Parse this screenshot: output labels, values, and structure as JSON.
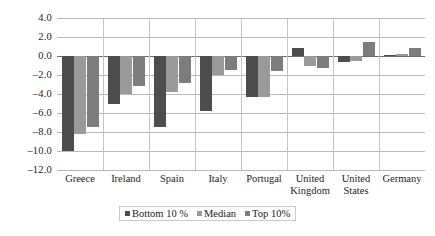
{
  "chart_data": {
    "type": "bar",
    "title": "",
    "subtitle": "",
    "xlabel": "",
    "ylabel": "",
    "ylim": [
      -12.0,
      4.0
    ],
    "yticks": [
      "4.0",
      "2.0",
      "0.0",
      "-2.0",
      "-4.0",
      "-6.0",
      "-8.0",
      "-10.0",
      "-12.0"
    ],
    "ytick_values": [
      4.0,
      2.0,
      0.0,
      -2.0,
      -4.0,
      -6.0,
      -8.0,
      -10.0,
      -12.0
    ],
    "grid": true,
    "legend_position": "bottom",
    "categories": [
      "Greece",
      "Ireland",
      "Spain",
      "Italy",
      "Portugal",
      "United Kingdom",
      "United States",
      "Germany"
    ],
    "series": [
      {
        "name": "Bottom 10 %",
        "color": "#4d4d4d",
        "values": [
          -10.0,
          -5.0,
          -7.5,
          -5.8,
          -4.3,
          0.8,
          -0.6,
          0.1
        ]
      },
      {
        "name": "Median",
        "color": "#9a9a9a",
        "values": [
          -8.2,
          -4.0,
          -3.8,
          -2.0,
          -4.3,
          -1.0,
          -0.5,
          0.2
        ]
      },
      {
        "name": "Top 10%",
        "color": "#7d7d7d",
        "values": [
          -7.5,
          -3.2,
          -2.8,
          -1.5,
          -1.6,
          -1.3,
          1.5,
          0.8
        ]
      }
    ]
  },
  "legend": {
    "items": [
      {
        "label": "Bottom 10 %"
      },
      {
        "label": "Median"
      },
      {
        "label": "Top 10%"
      }
    ]
  },
  "colors": {
    "series0": "#4d4d4d",
    "series1": "#9a9a9a",
    "series2": "#7d7d7d",
    "gridline": "#b9b9b9",
    "zeroline": "#6e6e6e",
    "text": "#1d1d1d",
    "background": "#ffffff"
  }
}
